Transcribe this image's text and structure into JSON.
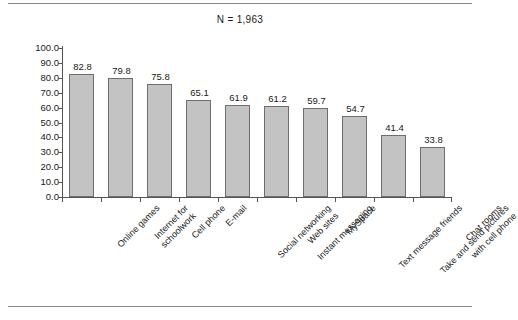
{
  "figure": {
    "title": "N = 1,963",
    "background_color": "#ffffff",
    "bar_fill_color": "#c3c3c3",
    "bar_border_color": "#6e6e6e",
    "axis_color": "#555555",
    "rule_color": "#888888"
  },
  "chart_data": {
    "type": "bar",
    "title": "N = 1,963",
    "xlabel": "",
    "ylabel": "",
    "ylim": [
      0.0,
      100.0
    ],
    "ytick_step": 10.0,
    "grid": false,
    "legend": null,
    "orientation": "vertical",
    "value_labels": true,
    "ytick_labels": [
      "100.0",
      "90.0",
      "80.0",
      "70.0",
      "60.0",
      "50.0",
      "40.0",
      "30.0",
      "20.0",
      "10.0",
      "0.0"
    ],
    "ytick_values": [
      100.0,
      90.0,
      80.0,
      70.0,
      60.0,
      50.0,
      40.0,
      30.0,
      20.0,
      10.0,
      0.0
    ],
    "categories": [
      "Online games",
      "Internet for schoolwork",
      "Cell phone",
      "E-mail",
      "Social networking Web sites",
      "Instant messaging",
      "MySpace",
      "Text message friends",
      "Take and send pictures with cell phone",
      "Chat rooms"
    ],
    "category_lines": [
      [
        "Online games"
      ],
      [
        "Internet for",
        "schoolwork"
      ],
      [
        "Cell phone"
      ],
      [
        "E-mail"
      ],
      [
        "Social networking",
        "Web sites"
      ],
      [
        "Instant messaging"
      ],
      [
        "MySpace"
      ],
      [
        "Text message friends"
      ],
      [
        "Take and send pictures",
        "with cell phone"
      ],
      [
        "Chat rooms"
      ]
    ],
    "values": [
      82.8,
      79.8,
      75.8,
      65.1,
      61.9,
      61.2,
      59.7,
      54.7,
      41.4,
      33.8
    ],
    "value_label_text": [
      "82.8",
      "79.8",
      "75.8",
      "65.1",
      "61.9",
      "61.2",
      "59.7",
      "54.7",
      "41.4",
      "33.8"
    ]
  }
}
